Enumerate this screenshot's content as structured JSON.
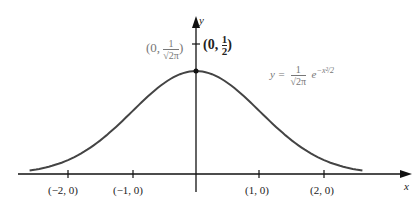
{
  "diagram": {
    "axes": {
      "x_label": "x",
      "y_label": "y"
    },
    "curve": {
      "equation": "y = (1/√(2π)) e^(−x²/2)",
      "color": "#444444"
    },
    "points": {
      "peak": "(0, 1/√(2π))",
      "half": "(0, 1/2)"
    },
    "tick_labels": [
      "(−2, 0)",
      "(−1, 0)",
      "(1, 0)",
      "(2, 0)"
    ]
  },
  "chart_data": {
    "type": "line",
    "title": "",
    "xlabel": "x",
    "ylabel": "y",
    "series": [
      {
        "name": "y = (1/√(2π)) e^(−x²/2)",
        "x": [
          -2.6,
          -2,
          -1,
          0,
          1,
          2,
          2.6
        ],
        "values": [
          0.0136,
          0.054,
          0.242,
          0.399,
          0.242,
          0.054,
          0.0136
        ]
      }
    ],
    "annotations": [
      "(0, 1/√(2π))",
      "(0, 1/2)",
      "(−2, 0)",
      "(−1, 0)",
      "(1, 0)",
      "(2, 0)"
    ]
  }
}
